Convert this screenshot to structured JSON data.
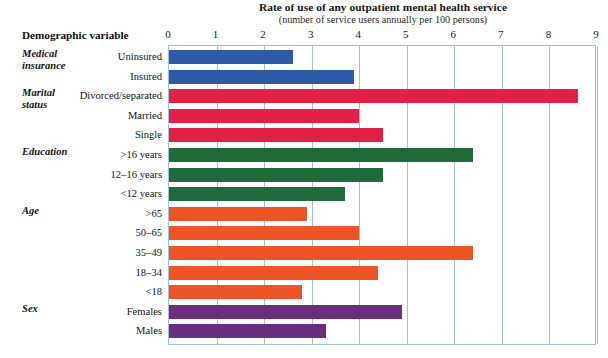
{
  "chart_data": {
    "type": "bar",
    "orientation": "horizontal",
    "title": "Rate of use of any outpatient mental health service",
    "subtitle": "(number of service users annually per 100 persons)",
    "xlabel": "",
    "ylabel": "Demographic variable",
    "xlim": [
      0,
      9
    ],
    "xticks": [
      "0",
      "1",
      "2",
      "3",
      "4",
      "5",
      "6",
      "7",
      "8",
      "9"
    ],
    "grid": true,
    "legend": "none",
    "categories": [
      "Uninsured",
      "Insured",
      "Divorced/separated",
      "Married",
      "Single",
      ">16 years",
      "12–16 years",
      "<12 years",
      ">65",
      "50–65",
      "35–49",
      "18–34",
      "<18",
      "Females",
      "Males"
    ],
    "values": [
      2.6,
      3.9,
      8.6,
      4.0,
      4.5,
      6.4,
      4.5,
      3.7,
      2.9,
      4.0,
      6.4,
      4.4,
      2.8,
      4.9,
      3.3
    ],
    "groups": [
      {
        "name": "Medical\ninsurance",
        "color": "#2E5BA8",
        "start": 0,
        "count": 2
      },
      {
        "name": "Marital\nstatus",
        "color": "#E02045",
        "start": 2,
        "count": 3
      },
      {
        "name": "Education",
        "color": "#1F6B3C",
        "start": 5,
        "count": 3
      },
      {
        "name": "Age",
        "color": "#EE5526",
        "start": 8,
        "count": 5
      },
      {
        "name": "Sex",
        "color": "#6B2D7E",
        "start": 13,
        "count": 2
      }
    ]
  },
  "header": {
    "variable_column_label": "Demographic variable"
  },
  "colors": {
    "grid": "#9fc0de",
    "medical_insurance": "#2E5BA8",
    "marital_status": "#E02045",
    "education": "#1F6B3C",
    "age": "#EE5526",
    "sex": "#6B2D7E",
    "background": "#ffffff",
    "text": "#141414"
  }
}
